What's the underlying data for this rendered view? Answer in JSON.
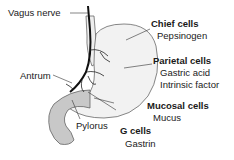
{
  "diagram": {
    "labels": {
      "vagus_nerve": "Vagus nerve",
      "antrum": "Antrum",
      "pylorus": "Pylorus",
      "chief_cells": {
        "title": "Chief cells",
        "secretes": [
          "Pepsinogen"
        ]
      },
      "parietal_cells": {
        "title": "Parietal cells",
        "secretes": [
          "Gastric acid",
          "Intrinsic factor"
        ]
      },
      "mucosal_cells": {
        "title": "Mucosal cells",
        "secretes": [
          "Mucus"
        ]
      },
      "g_cells": {
        "title": "G cells",
        "secretes": [
          "Gastrin"
        ]
      }
    },
    "colors": {
      "stomach_body": "#f2f2f2",
      "antrum_fill": "#c8c8c8",
      "outline": "#555555",
      "nerve": "#111111"
    }
  }
}
